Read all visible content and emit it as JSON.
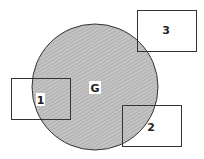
{
  "diagram": {
    "region": {
      "label": "G",
      "shape": "circle",
      "fill": "#b8b8b8",
      "stroke": "#333333"
    },
    "boxes": [
      {
        "label": "1"
      },
      {
        "label": "2"
      },
      {
        "label": "3"
      }
    ]
  }
}
